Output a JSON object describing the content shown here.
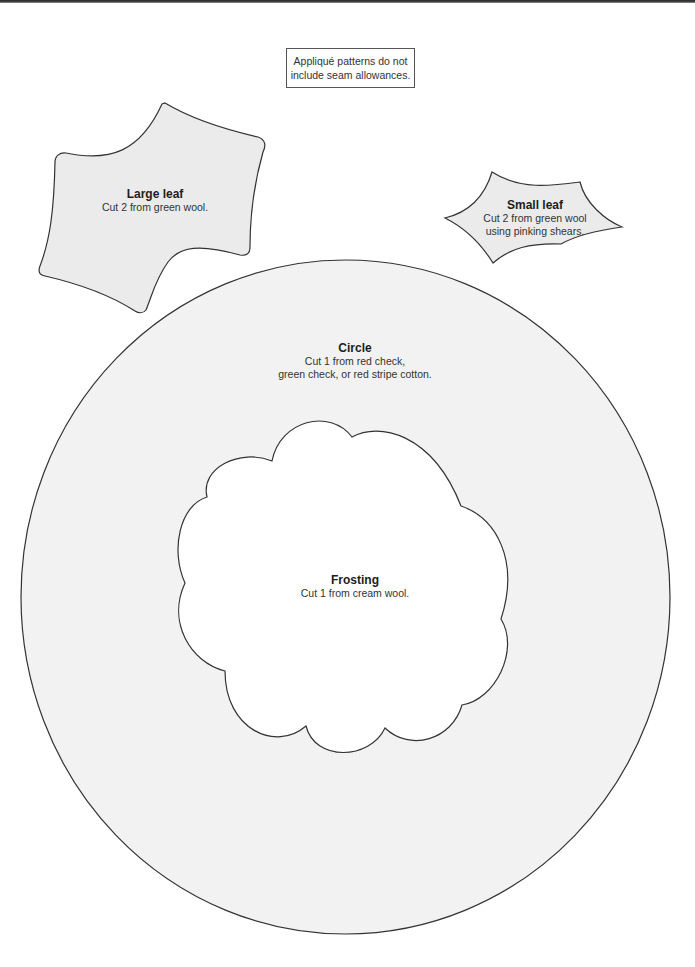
{
  "note": {
    "line1": "Appliqué patterns do not",
    "line2": "include seam allowances."
  },
  "pieces": {
    "large_leaf": {
      "title": "Large leaf",
      "instructions": [
        "Cut 2 from green wool."
      ],
      "fill": "#ebebeb"
    },
    "small_leaf": {
      "title": "Small leaf",
      "instructions": [
        "Cut 2 from green wool",
        "using pinking shears."
      ],
      "fill": "#ebebeb"
    },
    "circle": {
      "title": "Circle",
      "instructions": [
        "Cut 1 from red check,",
        "green check, or red stripe cotton."
      ],
      "fill": "#f2f2f2"
    },
    "frosting": {
      "title": "Frosting",
      "instructions": [
        "Cut 1 from cream wool."
      ],
      "fill": "#ffffff"
    }
  },
  "colors": {
    "outline": "#333333",
    "page": "#ffffff",
    "header_bar": "#2b2b2b"
  }
}
